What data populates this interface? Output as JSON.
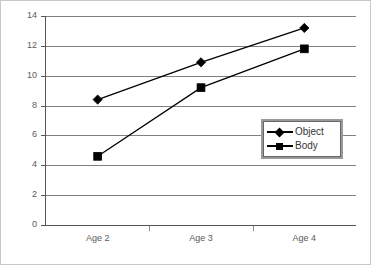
{
  "chart_data": {
    "type": "line",
    "title": "",
    "xlabel": "",
    "ylabel": "",
    "categories": [
      "Age 2",
      "Age 3",
      "Age 4"
    ],
    "ylim": [
      0,
      14
    ],
    "yticks": [
      0,
      2,
      4,
      6,
      8,
      10,
      12,
      14
    ],
    "ytick_labels": [
      "0",
      "2",
      "4",
      "6",
      "8",
      "10",
      "12",
      "14"
    ],
    "grid": true,
    "legend_position": "lower right (inside plot area)",
    "series": [
      {
        "name": "Object",
        "marker": "diamond",
        "color": "#000000",
        "values": [
          8.4,
          10.9,
          13.2
        ]
      },
      {
        "name": "Body",
        "marker": "square",
        "color": "#000000",
        "values": [
          4.6,
          9.2,
          11.8
        ]
      }
    ]
  },
  "legend": {
    "entries": [
      {
        "label": "Object",
        "marker": "diamond-marker-icon"
      },
      {
        "label": "Body",
        "marker": "square-marker-icon"
      }
    ]
  },
  "colors": {
    "series_line": "#000000",
    "gridline": "#808080",
    "axis": "#555555",
    "tick_text": "#5a5a5a",
    "background": "#ffffff",
    "figure_border": "#c8c8c8"
  }
}
